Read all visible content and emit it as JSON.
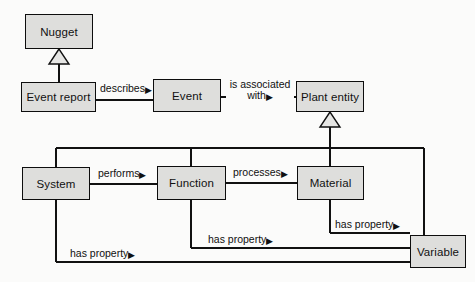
{
  "diagram": {
    "type": "uml-class-diagram",
    "background_color": "#fbfbfa",
    "node_fill_color": "#dededc",
    "node_border_color": "#0d0d0d",
    "line_color": "#111111",
    "nodes": [
      {
        "id": "nugget",
        "label": "Nugget",
        "x": 25,
        "y": 14,
        "w": 68,
        "h": 35
      },
      {
        "id": "event_report",
        "label": "Event report",
        "x": 21,
        "y": 82,
        "w": 75,
        "h": 30
      },
      {
        "id": "event",
        "label": "Event",
        "x": 153,
        "y": 79,
        "w": 68,
        "h": 33
      },
      {
        "id": "plant_entity",
        "label": "Plant entity",
        "x": 296,
        "y": 81,
        "w": 68,
        "h": 31
      },
      {
        "id": "system",
        "label": "System",
        "x": 22,
        "y": 167,
        "w": 68,
        "h": 33
      },
      {
        "id": "function",
        "label": "Function",
        "x": 157,
        "y": 166,
        "w": 69,
        "h": 34
      },
      {
        "id": "material",
        "label": "Material",
        "x": 297,
        "y": 166,
        "w": 67,
        "h": 34
      },
      {
        "id": "variable",
        "label": "Variable",
        "x": 410,
        "y": 235,
        "w": 56,
        "h": 33
      }
    ],
    "edge_labels": {
      "describes": "describes",
      "is_associated_with_line1": "is associated",
      "is_associated_with_line2": "with",
      "performs": "performs",
      "processes": "processes",
      "has_property_material": "has property",
      "has_property_function": "has property",
      "has_property_system": "has property",
      "arrow_glyph": "▶"
    },
    "relationships": [
      {
        "from": "event_report",
        "to": "nugget",
        "type": "generalization",
        "label": ""
      },
      {
        "from": "system",
        "to": "plant_entity",
        "type": "generalization",
        "label": ""
      },
      {
        "from": "function",
        "to": "plant_entity",
        "type": "generalization",
        "label": ""
      },
      {
        "from": "material",
        "to": "plant_entity",
        "type": "generalization",
        "label": ""
      },
      {
        "from": "variable",
        "to": "plant_entity",
        "type": "generalization",
        "label": ""
      },
      {
        "from": "event_report",
        "to": "event",
        "type": "association",
        "label": "describes"
      },
      {
        "from": "event",
        "to": "plant_entity",
        "type": "association",
        "label": "is associated with"
      },
      {
        "from": "system",
        "to": "function",
        "type": "association",
        "label": "performs"
      },
      {
        "from": "function",
        "to": "material",
        "type": "association",
        "label": "processes"
      },
      {
        "from": "material",
        "to": "variable",
        "type": "association",
        "label": "has property"
      },
      {
        "from": "function",
        "to": "variable",
        "type": "association",
        "label": "has property"
      },
      {
        "from": "system",
        "to": "variable",
        "type": "association",
        "label": "has property"
      }
    ]
  }
}
